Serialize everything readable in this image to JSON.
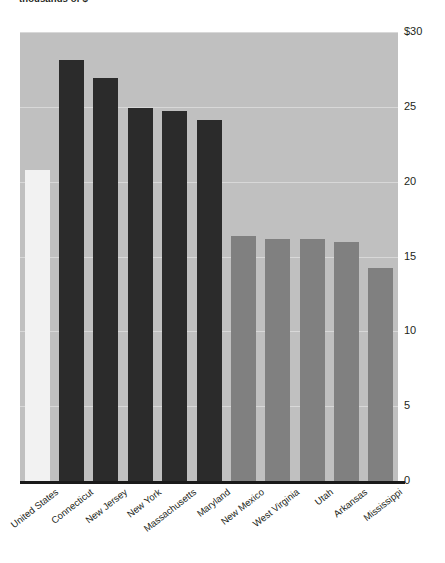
{
  "chart_data": {
    "type": "bar",
    "title": "thousands of $",
    "xlabel": "",
    "ylabel": "",
    "ylim": [
      0,
      30
    ],
    "grid": true,
    "legend": "none",
    "yticks": [
      "$30",
      "25",
      "20",
      "15",
      "10",
      "5",
      "0"
    ],
    "ytick_values": [
      30,
      25,
      20,
      15,
      10,
      5,
      0
    ],
    "categories": [
      "United States",
      "Connecticut",
      "New Jersey",
      "New York",
      "Massachusetts",
      "Maryland",
      "New Mexico",
      "West Virginia",
      "Utah",
      "Arkansas",
      "Mississippi"
    ],
    "values": [
      20.8,
      28.1,
      26.9,
      24.9,
      24.7,
      24.1,
      16.4,
      16.2,
      16.2,
      16.0,
      14.2
    ],
    "bar_groups": [
      "national",
      "high",
      "high",
      "high",
      "high",
      "high",
      "low",
      "low",
      "low",
      "low",
      "low"
    ],
    "colors": {
      "national": "#f2f2f2",
      "high": "#2b2b2b",
      "low": "#808080",
      "plot_background": "#c0c0c0",
      "gridline": "#d8d8d8",
      "axis": "#1a1a1a",
      "text": "#231f20",
      "page_background": "#ffffff"
    }
  }
}
